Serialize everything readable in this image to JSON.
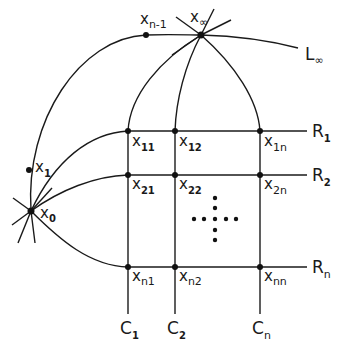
{
  "diagram": {
    "title": "",
    "points": {
      "x_inf": {
        "base": "x",
        "sub": "∞"
      },
      "x_n_minus_1": {
        "base": "x",
        "sub": "n-1"
      },
      "x_1": {
        "base": "x",
        "sub": "1"
      },
      "x_0": {
        "base": "x",
        "sub": "0"
      },
      "grid": [
        [
          {
            "base": "x",
            "sub": "11"
          },
          {
            "base": "x",
            "sub": "12"
          },
          {
            "base": "x",
            "sub": "1n"
          }
        ],
        [
          {
            "base": "x",
            "sub": "21"
          },
          {
            "base": "x",
            "sub": "22"
          },
          {
            "base": "x",
            "sub": "2n"
          }
        ],
        [
          {
            "base": "x",
            "sub": "n1"
          },
          {
            "base": "x",
            "sub": "n2"
          },
          {
            "base": "x",
            "sub": "nn"
          }
        ]
      ]
    },
    "lines": {
      "L_inf": {
        "base": "L",
        "sub": "∞"
      },
      "rows": [
        {
          "base": "R",
          "sub": "1"
        },
        {
          "base": "R",
          "sub": "2"
        },
        {
          "base": "R",
          "sub": "n"
        }
      ],
      "columns": [
        {
          "base": "C",
          "sub": "1"
        },
        {
          "base": "C",
          "sub": "2"
        },
        {
          "base": "C",
          "sub": "n"
        }
      ]
    },
    "ellipsis": "cross of dots"
  }
}
